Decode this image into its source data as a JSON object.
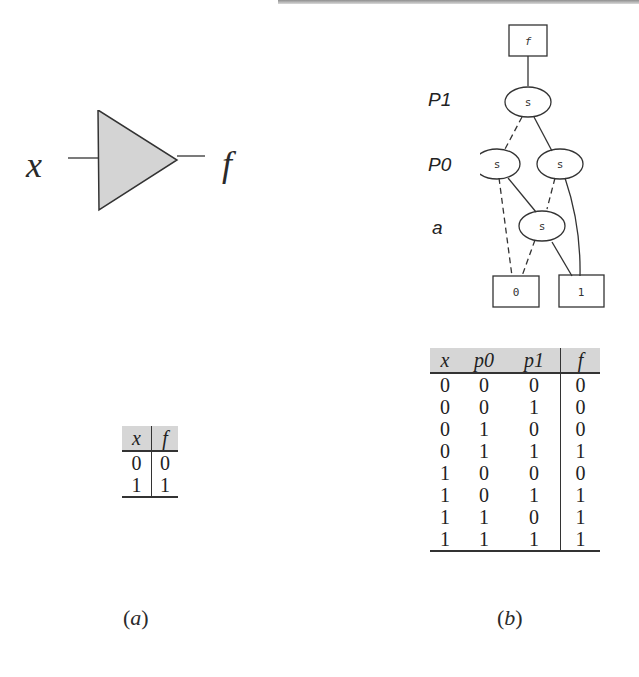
{
  "panel_a": {
    "caption_open": "(",
    "caption_letter": "a",
    "caption_close": ")",
    "gate": {
      "type": "buffer",
      "input_label": "x",
      "output_label": "f",
      "fill": "#d4d4d4"
    },
    "truth_table": {
      "headers": [
        "x",
        "f"
      ],
      "rows": [
        [
          "0",
          "0"
        ],
        [
          "1",
          "1"
        ]
      ]
    }
  },
  "panel_b": {
    "caption_open": "(",
    "caption_letter": "b",
    "caption_close": ")",
    "bdd": {
      "root_label": "f",
      "levels": [
        "P1",
        "P0",
        "a"
      ],
      "node_label": "s",
      "terminals": [
        "0",
        "1"
      ]
    },
    "truth_table": {
      "headers": [
        "x",
        "p0",
        "p1",
        "f"
      ],
      "rows": [
        [
          "0",
          "0",
          "0",
          "0"
        ],
        [
          "0",
          "0",
          "1",
          "0"
        ],
        [
          "0",
          "1",
          "0",
          "0"
        ],
        [
          "0",
          "1",
          "1",
          "1"
        ],
        [
          "1",
          "0",
          "0",
          "0"
        ],
        [
          "1",
          "0",
          "1",
          "1"
        ],
        [
          "1",
          "1",
          "0",
          "1"
        ],
        [
          "1",
          "1",
          "1",
          "1"
        ]
      ]
    }
  }
}
